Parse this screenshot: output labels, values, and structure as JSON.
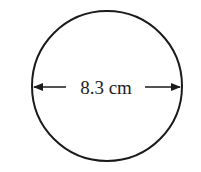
{
  "diagram": {
    "shape": "circle",
    "dimension": "diameter",
    "label": "8.3 cm",
    "value": 8.3,
    "unit": "cm",
    "stroke_color": "#1a1a1a"
  }
}
